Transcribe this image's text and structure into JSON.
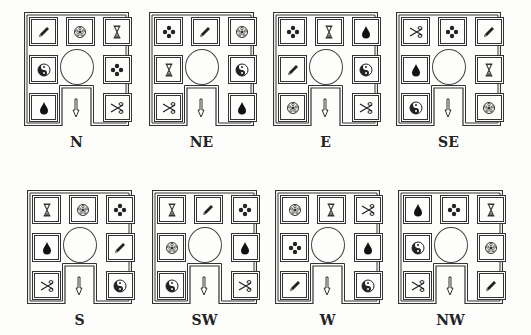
{
  "panels": [
    {
      "label": "N",
      "x": 24,
      "y": 12,
      "cells": [
        "pencil",
        "flower",
        "hourglass",
        "yinyang",
        "diamond4",
        "drop",
        "scissors"
      ]
    },
    {
      "label": "NE",
      "x": 149,
      "y": 12,
      "cells": [
        "diamond4",
        "pencil",
        "flower",
        "hourglass",
        "yinyang",
        "scissors",
        "drop"
      ]
    },
    {
      "label": "E",
      "x": 273,
      "y": 12,
      "cells": [
        "diamond4",
        "hourglass",
        "drop",
        "pencil",
        "yinyang",
        "flower",
        "scissors"
      ]
    },
    {
      "label": "SE",
      "x": 396,
      "y": 12,
      "cells": [
        "scissors",
        "diamond4",
        "pencil",
        "drop",
        "hourglass",
        "yinyang",
        "flower"
      ]
    },
    {
      "label": "S",
      "x": 27,
      "y": 190,
      "cells": [
        "hourglass",
        "flower",
        "diamond4",
        "drop",
        "pencil",
        "scissors",
        "yinyang"
      ]
    },
    {
      "label": "SW",
      "x": 152,
      "y": 190,
      "cells": [
        "hourglass",
        "pencil",
        "diamond4",
        "flower",
        "drop",
        "yinyang",
        "scissors"
      ]
    },
    {
      "label": "W",
      "x": 275,
      "y": 190,
      "cells": [
        "flower",
        "hourglass",
        "scissors",
        "diamond4",
        "drop",
        "pencil",
        "yinyang"
      ]
    },
    {
      "label": "NW",
      "x": 398,
      "y": 190,
      "cells": [
        "drop",
        "diamond4",
        "hourglass",
        "yinyang",
        "flower",
        "scissors",
        "pencil"
      ]
    }
  ],
  "cell_order": [
    "top-left",
    "top-center",
    "top-right",
    "middle-left",
    "middle-right",
    "bottom-left",
    "bottom-right"
  ],
  "colors": {
    "line": "#333333",
    "background": "#fdfdfb"
  }
}
